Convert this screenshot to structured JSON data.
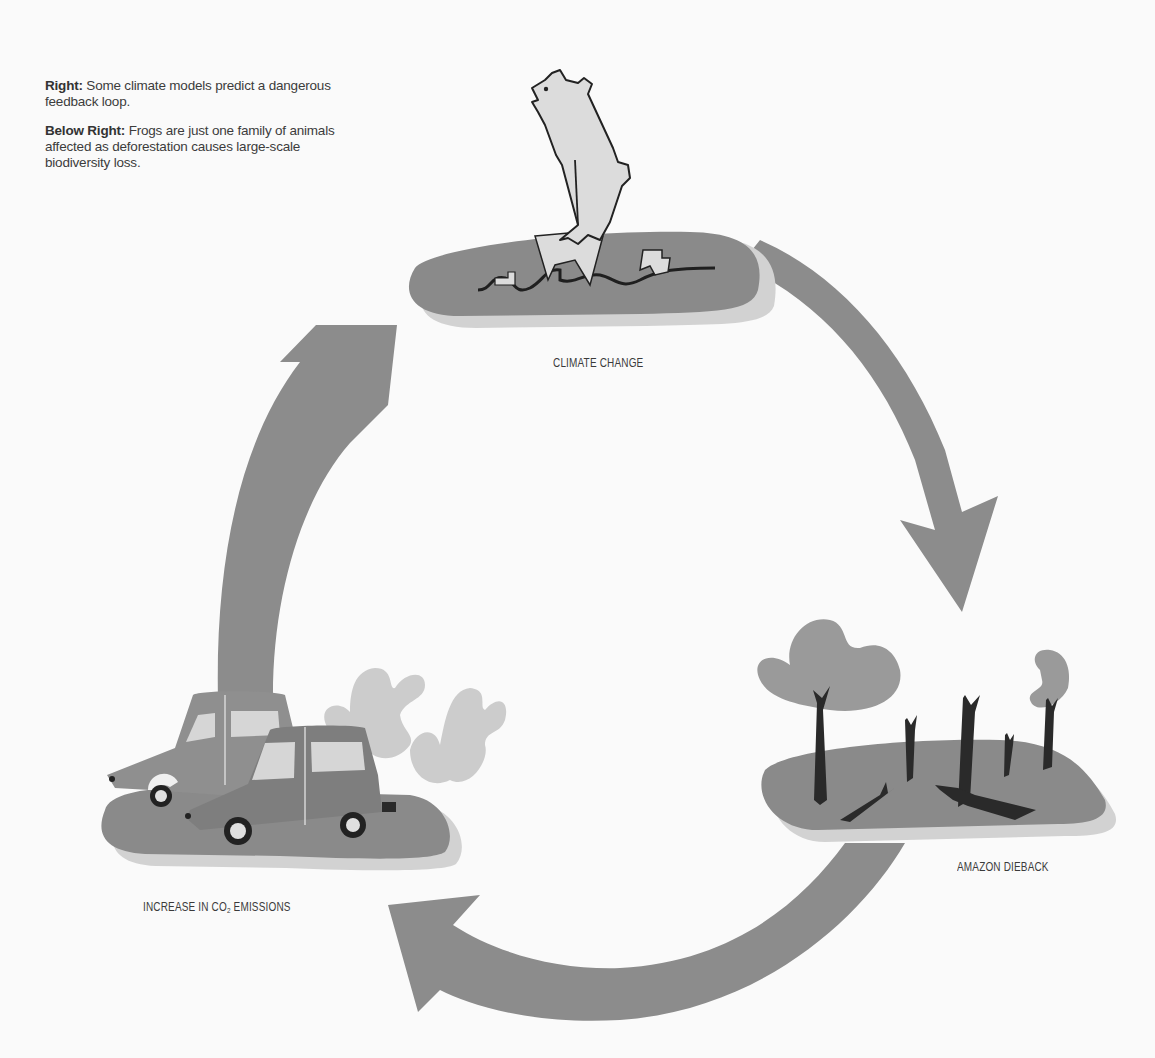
{
  "captions": [
    {
      "bold": "Right:",
      "text": " Some climate models predict a dangerous feedback loop."
    },
    {
      "bold": "Below Right:",
      "text": " Frogs are just one family of animals affected as deforestation causes large-scale biodiversity loss."
    }
  ],
  "diagram": {
    "type": "cycle",
    "nodes": [
      {
        "id": "climate-change",
        "label": "CLIMATE CHANGE",
        "icon": "polar-bear-on-melting-ice-icon"
      },
      {
        "id": "amazon-dieback",
        "label": "AMAZON DIEBACK",
        "icon": "dead-trees-icon"
      },
      {
        "id": "co2-emissions",
        "label_pre": "INCREASE IN CO",
        "label_sub": "2",
        "label_post": " EMISSIONS",
        "icon": "cars-with-exhaust-icon"
      }
    ],
    "edges": [
      {
        "from": "climate-change",
        "to": "amazon-dieback"
      },
      {
        "from": "amazon-dieback",
        "to": "co2-emissions"
      },
      {
        "from": "co2-emissions",
        "to": "climate-change"
      }
    ]
  },
  "colors": {
    "background": "#fafafa",
    "arrow": "#8c8c8c",
    "platform": "#8a8a8a",
    "platform_shadow": "#cfcfcf",
    "ice": "#dcdcdc",
    "tree_trunk": "#2a2a2a",
    "foliage": "#9a9a9a",
    "smoke": "#cccccc",
    "car_back": "#8f8f8f",
    "car_front": "#7e7e7e",
    "window": "#d6d6d6"
  }
}
